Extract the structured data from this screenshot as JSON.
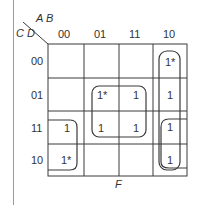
{
  "kmap": {
    "row_var_label": "C D",
    "col_var_label": "A B",
    "function_label": "F",
    "col_headers": [
      "00",
      "01",
      "11",
      "10"
    ],
    "row_headers": [
      "00",
      "01",
      "11",
      "10"
    ],
    "cells": [
      [
        "",
        "",
        "",
        "1*"
      ],
      [
        "",
        "1*",
        "1",
        "1"
      ],
      [
        "1",
        "1",
        "1",
        "1"
      ],
      [
        "1*",
        "",
        "",
        "1"
      ]
    ],
    "groups": [
      {
        "name": "quad-center",
        "cells": "rows 01-11, cols 01-11"
      },
      {
        "name": "pair-left",
        "cells": "rows 11-10, col 00"
      },
      {
        "name": "column-right",
        "cells": "rows 00-10, col 10"
      },
      {
        "name": "pair-right-bottom",
        "cells": "rows 11-10, col 10"
      }
    ],
    "colors": {
      "line": "#3a3a3a",
      "text": "#2a2a2a"
    }
  }
}
